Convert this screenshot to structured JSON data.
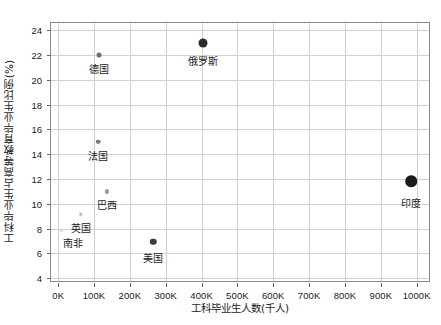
{
  "chart_data": {
    "type": "scatter",
    "title": "",
    "xlabel": "工科毕业生人数(千人)",
    "ylabel": "工科毕业生占高等教育毕业生比例(%)",
    "xlim": [
      -20000,
      1040000
    ],
    "ylim": [
      3.6,
      24.6
    ],
    "xticks": [
      0,
      100000,
      200000,
      300000,
      400000,
      500000,
      600000,
      700000,
      800000,
      900000,
      1000000
    ],
    "xticklabels": [
      "0K",
      "100K",
      "200K",
      "300K",
      "400K",
      "500K",
      "600K",
      "700K",
      "800K",
      "900K",
      "1000K"
    ],
    "yticks": [
      4,
      6,
      8,
      10,
      12,
      14,
      16,
      18,
      20,
      22,
      24
    ],
    "yticklabels": [
      "4",
      "6",
      "8",
      "10",
      "12",
      "14",
      "16",
      "18",
      "20",
      "22",
      "24"
    ],
    "grid": true,
    "legend": "none",
    "points": [
      {
        "label": "印度",
        "x": 985000,
        "y": 11.8,
        "size": 11.5,
        "color": "#1a1a1a",
        "label_dx": 0,
        "label_dy": 8
      },
      {
        "label": "俄罗斯",
        "x": 405000,
        "y": 23.0,
        "size": 9.0,
        "color": "#2b2b2b",
        "label_dx": 0,
        "label_dy": 6
      },
      {
        "label": "美国",
        "x": 265000,
        "y": 6.95,
        "size": 6.5,
        "color": "#3a3a3a",
        "label_dx": 0,
        "label_dy": 5
      },
      {
        "label": "德国",
        "x": 115000,
        "y": 22.05,
        "size": 5.0,
        "color": "#6e6e6e",
        "label_dx": 0,
        "label_dy": 4
      },
      {
        "label": "法国",
        "x": 112000,
        "y": 15.0,
        "size": 4.6,
        "color": "#7a7a7a",
        "label_dx": 0,
        "label_dy": 4
      },
      {
        "label": "巴西",
        "x": 137000,
        "y": 11.0,
        "size": 4.2,
        "color": "#9a9a9a",
        "label_dx": 0,
        "label_dy": 4
      },
      {
        "label": "英国",
        "x": 63000,
        "y": 9.15,
        "size": 3.4,
        "color": "#c2c2c2",
        "label_dx": 0,
        "label_dy": 4
      },
      {
        "label": "南非",
        "x": 8000,
        "y": 7.85,
        "size": 2.6,
        "color": "#d2d2d2",
        "label_dx": 12,
        "label_dy": 3
      }
    ]
  }
}
